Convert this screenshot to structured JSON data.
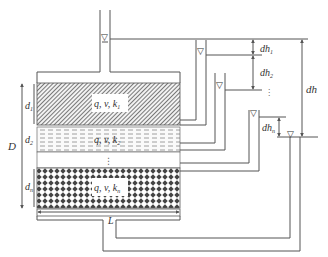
{
  "diagram": {
    "type": "layered soil permeameter schematic",
    "layers": [
      {
        "id": "layer-1",
        "label": "q, v, k",
        "sub": "1",
        "thickness_label": "d",
        "thickness_sub": "1",
        "pattern": "hatched"
      },
      {
        "id": "layer-2",
        "label": "q, v, k",
        "sub": "2",
        "thickness_label": "d",
        "thickness_sub": "2",
        "pattern": "dashed"
      },
      {
        "id": "layer-n",
        "label": "q, v, k",
        "sub": "n",
        "thickness_label": "d",
        "thickness_sub": "n",
        "pattern": "diamond"
      }
    ],
    "ellipsis_vertical": "⋮",
    "total_thickness_label": "D",
    "length_label": "L",
    "head_labels": {
      "dh1": {
        "main": "dh",
        "sub": "1"
      },
      "dh2": {
        "main": "dh",
        "sub": "2"
      },
      "dhn": {
        "main": "dh",
        "sub": "n"
      },
      "dh_total": "dh"
    },
    "water_level_icon": "▽"
  }
}
